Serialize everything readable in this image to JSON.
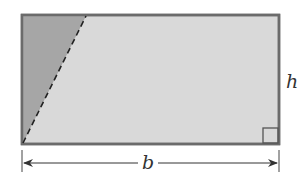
{
  "diagram": {
    "labels": {
      "base": "b",
      "height": "h"
    },
    "colors": {
      "rectangle_fill": "#d9d9d9",
      "triangle_fill": "#a6a6a6",
      "outline": "#6b6b6b",
      "dimension_line": "#333333"
    },
    "annotations": {
      "right_angle_marker": "bottom-right corner",
      "dashed_line": "from bottom-left corner to top edge"
    }
  }
}
